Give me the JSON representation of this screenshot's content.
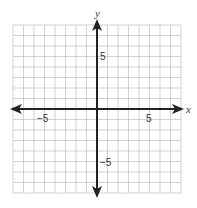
{
  "chart_data": {
    "type": "coordinate-grid",
    "title": "",
    "xlabel": "x",
    "ylabel": "y",
    "xlim": [
      -8,
      8
    ],
    "ylim": [
      -8,
      8
    ],
    "grid": true,
    "grid_step": 1,
    "ticks_labeled": {
      "x": [
        {
          "value": -5,
          "label": "−5"
        },
        {
          "value": 5,
          "label": "5"
        }
      ],
      "y": [
        {
          "value": 5,
          "label": "5"
        },
        {
          "value": -5,
          "label": "−5"
        }
      ]
    },
    "axes_arrows": "both ends",
    "series": []
  },
  "style": {
    "grid_color": "#bdbdbd",
    "axis_color": "#222222",
    "label_color": "#333333"
  },
  "labels": {
    "x_axis": "x",
    "y_axis": "y",
    "x_neg5": "−5",
    "x_pos5": "5",
    "y_pos5": "5",
    "y_neg5": "−5"
  }
}
